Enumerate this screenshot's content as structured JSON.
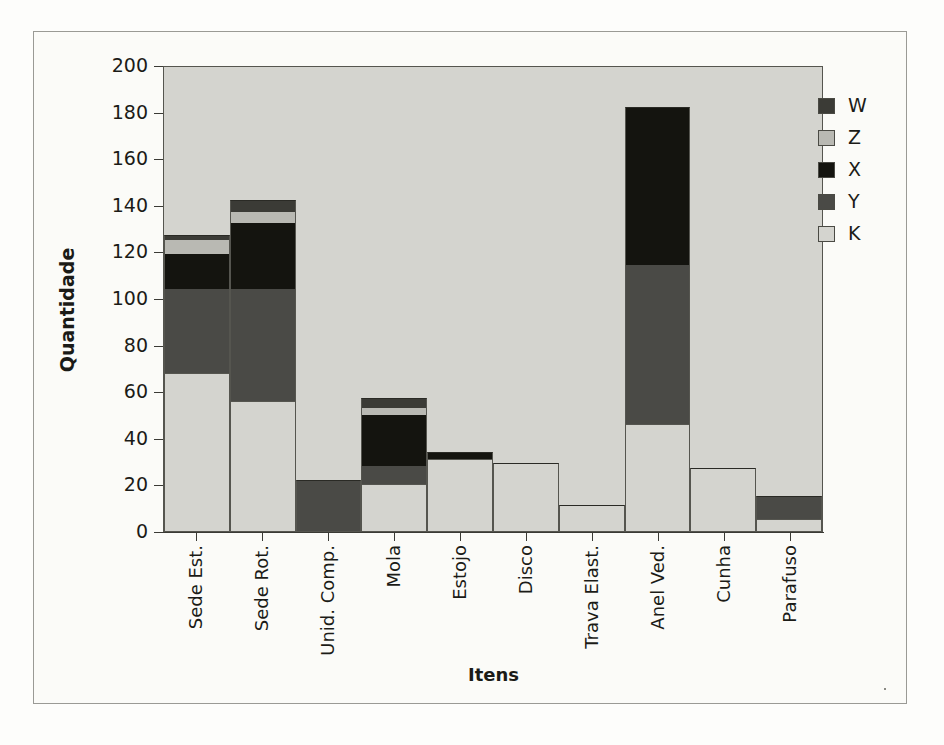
{
  "chart_data": {
    "type": "bar",
    "subtype": "stacked-bar",
    "title": "",
    "xlabel": "Itens",
    "ylabel": "Quantidade",
    "ylim": [
      0,
      200
    ],
    "yticks": [
      0,
      20,
      40,
      60,
      80,
      100,
      120,
      140,
      160,
      180,
      200
    ],
    "grid": false,
    "legend_position": "right",
    "categories": [
      "Sede Est.",
      "Sede Rot.",
      "Unid. Comp.",
      "Mola",
      "Estojo",
      "Disco",
      "Trava Elast.",
      "Anel Ved.",
      "Cunha",
      "Parafuso"
    ],
    "series": [
      {
        "name": "K",
        "color": "#d4d4cf",
        "values": [
          68,
          56,
          0,
          20,
          31,
          29,
          11,
          46,
          27,
          5
        ]
      },
      {
        "name": "Y",
        "color": "#4a4a46",
        "values": [
          36,
          48,
          22,
          8,
          0,
          0,
          0,
          68,
          0,
          10
        ]
      },
      {
        "name": "X",
        "color": "#14140f",
        "values": [
          15,
          28,
          0,
          22,
          3,
          0,
          0,
          68,
          0,
          0
        ]
      },
      {
        "name": "Z",
        "color": "#b9b9b3",
        "values": [
          6,
          5,
          0,
          3,
          0,
          0,
          0,
          0,
          0,
          0
        ]
      },
      {
        "name": "W",
        "color": "#3b3b36",
        "values": [
          2,
          5,
          0,
          4,
          0,
          0,
          0,
          0,
          0,
          0
        ]
      }
    ],
    "stack_order_bottom_to_top": [
      "K",
      "Y",
      "X",
      "Z",
      "W"
    ],
    "totals": [
      127,
      142,
      22,
      57,
      34,
      29,
      11,
      182,
      27,
      15
    ]
  },
  "legend": {
    "entries": [
      {
        "label": "W",
        "color": "#3b3b36"
      },
      {
        "label": "Z",
        "color": "#b9b9b3"
      },
      {
        "label": "X",
        "color": "#14140f"
      },
      {
        "label": "Y",
        "color": "#4a4a46"
      },
      {
        "label": "K",
        "color": "#d4d4cf"
      }
    ]
  },
  "axes": {
    "y_title": "Quantidade",
    "x_title": "Itens",
    "y_tick_labels": [
      "200",
      "180",
      "160",
      "140",
      "120",
      "100",
      "80",
      "60",
      "40",
      "20",
      "0"
    ]
  },
  "colors": {
    "plot_background": "#d4d4cf",
    "page_background": "#fdfdfb",
    "axis": "#3a3a35",
    "frame": "#9a9a95",
    "text": "#1b1b17"
  }
}
